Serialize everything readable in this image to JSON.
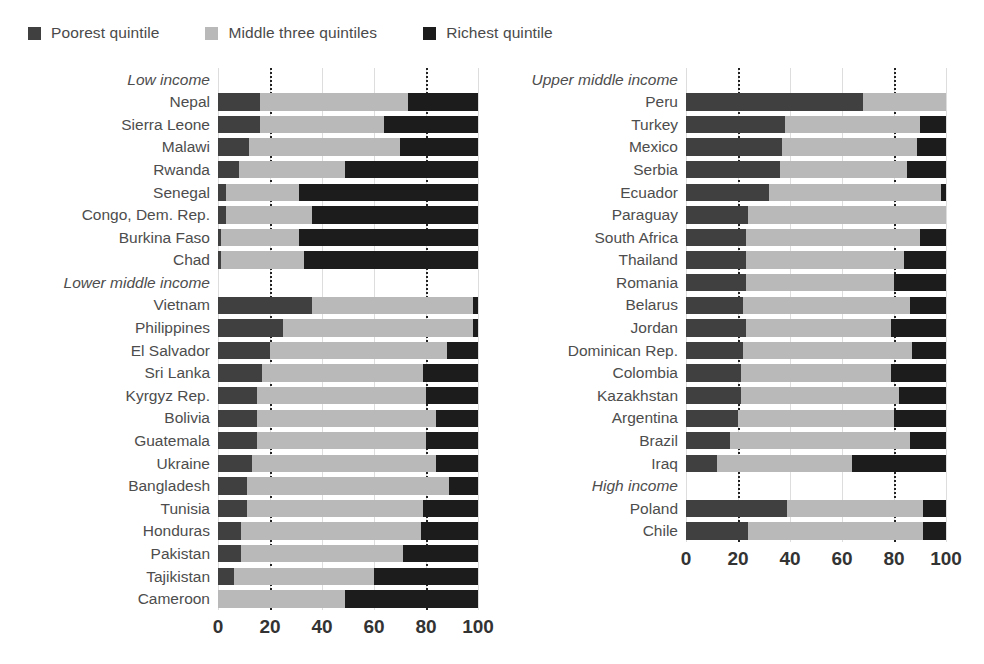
{
  "legend": {
    "items": [
      {
        "label": "Poorest quintile",
        "color": "#404040",
        "name": "legend-poorest"
      },
      {
        "label": "Middle three quintiles",
        "color": "#b9b9b9",
        "name": "legend-middle"
      },
      {
        "label": "Richest quintile",
        "color": "#1c1c1c",
        "name": "legend-richest"
      }
    ]
  },
  "colors": {
    "poorest": "#404040",
    "middle": "#b9b9b9",
    "richest": "#1c1c1c",
    "gridline": "#dddddd",
    "refline": "#222222",
    "text": "#4d4d4d"
  },
  "axis": {
    "ticks": [
      "0",
      "20",
      "40",
      "60",
      "80",
      "100"
    ],
    "tick_values": [
      0,
      20,
      40,
      60,
      80,
      100
    ],
    "min": 0,
    "max": 100,
    "reference_lines": [
      20,
      80
    ]
  },
  "chart_data": {
    "type": "bar",
    "subtype": "stacked-horizontal-100pct",
    "title": "",
    "xlabel": "",
    "ylabel": "",
    "xlim": [
      0,
      100
    ],
    "grid": true,
    "legend_position": "top-left",
    "series": [
      {
        "name": "Poorest quintile",
        "color": "#404040"
      },
      {
        "name": "Middle three quintiles",
        "color": "#b9b9b9"
      },
      {
        "name": "Richest quintile",
        "color": "#1c1c1c"
      }
    ],
    "panels": [
      {
        "panel": "left",
        "groups": [
          {
            "group": "Low income",
            "rows": [
              {
                "label": "Nepal",
                "values": [
                  16,
                  57,
                  27
                ]
              },
              {
                "label": "Sierra Leone",
                "values": [
                  16,
                  48,
                  36
                ]
              },
              {
                "label": "Malawi",
                "values": [
                  12,
                  58,
                  30
                ]
              },
              {
                "label": "Rwanda",
                "values": [
                  8,
                  41,
                  51
                ]
              },
              {
                "label": "Senegal",
                "values": [
                  3,
                  28,
                  69
                ]
              },
              {
                "label": "Congo, Dem. Rep.",
                "values": [
                  3,
                  33,
                  64
                ]
              },
              {
                "label": "Burkina Faso",
                "values": [
                  1,
                  30,
                  69
                ]
              },
              {
                "label": "Chad",
                "values": [
                  1,
                  32,
                  67
                ]
              }
            ]
          },
          {
            "group": "Lower middle income",
            "rows": [
              {
                "label": "Vietnam",
                "values": [
                  36,
                  62,
                  2
                ]
              },
              {
                "label": "Philippines",
                "values": [
                  25,
                  73,
                  2
                ]
              },
              {
                "label": "El Salvador",
                "values": [
                  20,
                  68,
                  12
                ]
              },
              {
                "label": "Sri Lanka",
                "values": [
                  17,
                  62,
                  21
                ]
              },
              {
                "label": "Kyrgyz Rep.",
                "values": [
                  15,
                  65,
                  20
                ]
              },
              {
                "label": "Bolivia",
                "values": [
                  15,
                  69,
                  16
                ]
              },
              {
                "label": "Guatemala",
                "values": [
                  15,
                  65,
                  20
                ]
              },
              {
                "label": "Ukraine",
                "values": [
                  13,
                  71,
                  16
                ]
              },
              {
                "label": "Bangladesh",
                "values": [
                  11,
                  78,
                  11
                ]
              },
              {
                "label": "Tunisia",
                "values": [
                  11,
                  68,
                  21
                ]
              },
              {
                "label": "Honduras",
                "values": [
                  9,
                  69,
                  22
                ]
              },
              {
                "label": "Pakistan",
                "values": [
                  9,
                  62,
                  29
                ]
              },
              {
                "label": "Tajikistan",
                "values": [
                  6,
                  54,
                  40
                ]
              },
              {
                "label": "Cameroon",
                "values": [
                  0,
                  49,
                  51
                ]
              }
            ]
          }
        ]
      },
      {
        "panel": "right",
        "groups": [
          {
            "group": "Upper middle income",
            "rows": [
              {
                "label": "Peru",
                "values": [
                  68,
                  32,
                  0
                ]
              },
              {
                "label": "Turkey",
                "values": [
                  38,
                  52,
                  10
                ]
              },
              {
                "label": "Mexico",
                "values": [
                  37,
                  52,
                  11
                ]
              },
              {
                "label": "Serbia",
                "values": [
                  36,
                  49,
                  15
                ]
              },
              {
                "label": "Ecuador",
                "values": [
                  32,
                  66,
                  2
                ]
              },
              {
                "label": "Paraguay",
                "values": [
                  24,
                  76,
                  0
                ]
              },
              {
                "label": "South Africa",
                "values": [
                  23,
                  67,
                  10
                ]
              },
              {
                "label": "Thailand",
                "values": [
                  23,
                  61,
                  16
                ]
              },
              {
                "label": "Romania",
                "values": [
                  23,
                  57,
                  20
                ]
              },
              {
                "label": "Belarus",
                "values": [
                  22,
                  64,
                  14
                ]
              },
              {
                "label": "Jordan",
                "values": [
                  23,
                  56,
                  21
                ]
              },
              {
                "label": "Dominican Rep.",
                "values": [
                  22,
                  65,
                  13
                ]
              },
              {
                "label": "Colombia",
                "values": [
                  21,
                  58,
                  21
                ]
              },
              {
                "label": "Kazakhstan",
                "values": [
                  21,
                  61,
                  18
                ]
              },
              {
                "label": "Argentina",
                "values": [
                  20,
                  60,
                  20
                ]
              },
              {
                "label": "Brazil",
                "values": [
                  17,
                  69,
                  14
                ]
              },
              {
                "label": "Iraq",
                "values": [
                  12,
                  52,
                  36
                ]
              }
            ]
          },
          {
            "group": "High income",
            "rows": [
              {
                "label": "Poland",
                "values": [
                  39,
                  52,
                  9
                ]
              },
              {
                "label": "Chile",
                "values": [
                  24,
                  67,
                  9
                ]
              }
            ]
          }
        ]
      }
    ]
  }
}
